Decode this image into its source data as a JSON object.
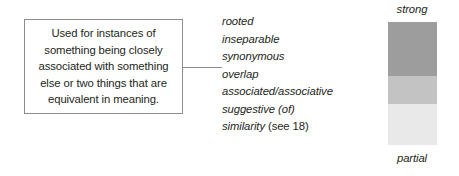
{
  "diagram": {
    "description_box": {
      "text": "Used for instances of something being closely associated with something else or two things that are equivalent in meaning."
    },
    "terms": [
      {
        "term": "rooted",
        "note": ""
      },
      {
        "term": "inseparable",
        "note": ""
      },
      {
        "term": "synonymous",
        "note": ""
      },
      {
        "term": "overlap",
        "note": ""
      },
      {
        "term": "associated/associative",
        "note": ""
      },
      {
        "term": "suggestive (of)",
        "note": ""
      },
      {
        "term": "similarity",
        "note": " (see 18)"
      }
    ],
    "strength_scale": {
      "top_label": "strong",
      "bottom_label": "partial",
      "bands": [
        {
          "name": "strong-band",
          "color": "#9d9d9d",
          "height_pct": 44
        },
        {
          "name": "moderate-band",
          "color": "#c3c3c3",
          "height_pct": 23
        },
        {
          "name": "partial-band",
          "color": "#e9e9e9",
          "height_pct": 33
        }
      ]
    },
    "colors": {
      "box_border": "#8c8c8c",
      "connector": "#8c8c8c",
      "text": "#231f20",
      "background": "#ffffff"
    }
  }
}
